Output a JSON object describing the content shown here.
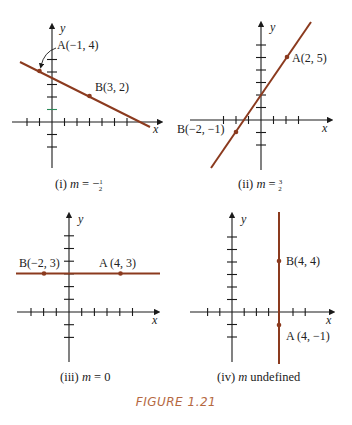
{
  "figure": {
    "title": "FIGURE 1.21",
    "title_color": "#b5683f",
    "line_color": "#8b3a1e",
    "axis_color": "#1a1a1a"
  },
  "panels": [
    {
      "id": "i",
      "caption_prefix": "(i)",
      "caption_var": "m",
      "caption_rest": " = −",
      "caption_frac_num": "1",
      "caption_frac_den": "2",
      "points": [
        {
          "name": "A",
          "label": "A(−1, 4)",
          "x": -1,
          "y": 4
        },
        {
          "name": "B",
          "label": "B(3, 2)",
          "x": 3,
          "y": 2
        }
      ],
      "x_axis_label": "x",
      "y_axis_label": "y",
      "slope": "-1/2"
    },
    {
      "id": "ii",
      "caption_prefix": "(ii)",
      "caption_var": "m",
      "caption_rest": " = ",
      "caption_frac_num": "3",
      "caption_frac_den": "2",
      "points": [
        {
          "name": "A",
          "label": "A(2, 5)",
          "x": 2,
          "y": 5
        },
        {
          "name": "B",
          "label": "B(−2, −1)",
          "x": -2,
          "y": -1
        }
      ],
      "x_axis_label": "x",
      "y_axis_label": "y",
      "slope": "3/2"
    },
    {
      "id": "iii",
      "caption_prefix": "(iii)",
      "caption_var": "m",
      "caption_rest": " = 0",
      "points": [
        {
          "name": "B",
          "label": "B(−2, 3)",
          "x": -2,
          "y": 3
        },
        {
          "name": "A",
          "label": "A (4, 3)",
          "x": 4,
          "y": 3
        }
      ],
      "x_axis_label": "x",
      "y_axis_label": "y",
      "slope": "0"
    },
    {
      "id": "iv",
      "caption_prefix": "(iv)",
      "caption_var": "m",
      "caption_rest": " undefined",
      "points": [
        {
          "name": "B",
          "label": "B(4, 4)",
          "x": 4,
          "y": 4
        },
        {
          "name": "A",
          "label": "A (4, −1)",
          "x": 4,
          "y": -1
        }
      ],
      "x_axis_label": "x",
      "y_axis_label": "y",
      "slope": "undefined"
    }
  ]
}
